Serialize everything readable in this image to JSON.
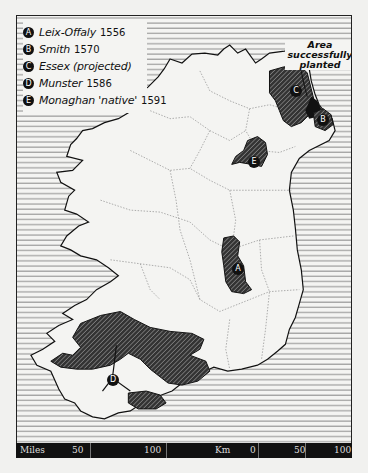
{
  "map": {
    "title_region": "Ireland",
    "legend": {
      "items": [
        {
          "key": "A",
          "label": "Leix-Offaly",
          "year": "1556"
        },
        {
          "key": "B",
          "label": "Smith",
          "year": "1570"
        },
        {
          "key": "C",
          "label": "Essex (projected)",
          "year": ""
        },
        {
          "key": "D",
          "label": "Munster",
          "year": "1586"
        },
        {
          "key": "E",
          "label": "Monaghan 'native'",
          "year": "1591"
        }
      ]
    },
    "annotation": {
      "line1": "Area",
      "line2": "successfully",
      "line3": "planted"
    },
    "plantation_labels": {
      "A": "A",
      "B": "B",
      "C": "C",
      "D": "D",
      "E": "E"
    },
    "colors": {
      "land": "#f4f4f2",
      "sea_hatch": "#555555",
      "plantation_fill": "#3a3a3a",
      "ink": "#111111"
    },
    "scale": {
      "miles": {
        "unit": "Miles",
        "ticks": [
          "50",
          "100"
        ]
      },
      "km": {
        "unit": "Km",
        "ticks": [
          "0",
          "50",
          "100"
        ]
      }
    }
  }
}
